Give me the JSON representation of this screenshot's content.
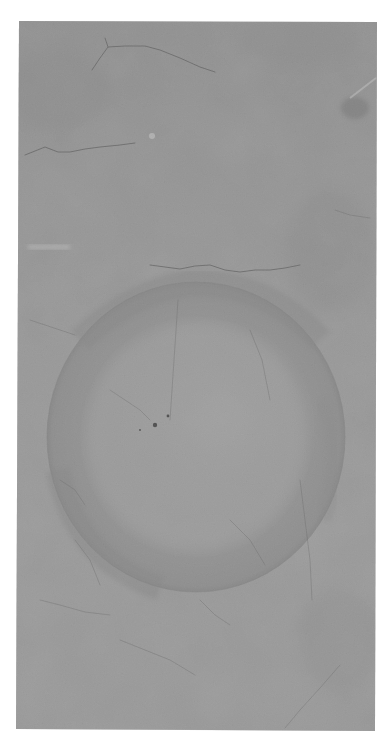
{
  "image": {
    "description": "Photograph of a cracked grey concrete surface with a large circular ring stain",
    "background_color": "#ffffff",
    "photo": {
      "bounds": {
        "x1": 18,
        "y1": 21,
        "x2": 376,
        "y2": 731
      },
      "base_color": "#9a9a9a",
      "light_color": "#ababab",
      "dark_color": "#858585"
    },
    "ring_stain": {
      "cx": 196,
      "cy": 437,
      "rx": 149,
      "ry": 155,
      "ring_color": "#8a8a8a",
      "inner_color": "#a6a6a6",
      "edge_color": "#7e7e7e"
    },
    "specks": [
      {
        "x": 155,
        "y": 425,
        "r": 2.2
      },
      {
        "x": 168,
        "y": 416,
        "r": 1.4
      },
      {
        "x": 140,
        "y": 430,
        "r": 0.9
      }
    ],
    "marks": {
      "light_streak_left": {
        "x": 28,
        "y": 245,
        "w": 42,
        "h": 4
      },
      "light_fleck": {
        "x": 152,
        "y": 136,
        "r": 3
      },
      "dark_smudge_right": {
        "x": 355,
        "y": 108,
        "rx": 14,
        "ry": 11
      }
    },
    "cracks": [
      "M92,70 L100,58 L108,47 L125,46 L145,46 L160,50 L180,58 L200,67 L215,72",
      "M108,47 L105,38",
      "M25,155 L45,147 L58,152 L70,152 L85,149 L100,147 L120,145 L135,143",
      "M150,265 L165,267 L180,269 L195,266 L210,265 L225,270 L240,272 L255,270 L270,270 L285,268 L300,265",
      "M340,665 L320,688 L300,710 L285,728",
      "M30,320 L45,325 L60,330 L75,335",
      "M178,300 L176,330 L174,360 L172,390 L170,420",
      "M110,390 L125,400 L140,410 L150,420",
      "M250,330 L262,360 L270,400",
      "M40,600 L60,605 L85,612 L110,615",
      "M120,640 L145,650 L170,660 L195,675",
      "M300,480 L305,520 L310,560 L312,600",
      "M60,480 L75,490 L85,505",
      "M230,520 L250,540 L265,565",
      "M335,210 L350,215 L370,218",
      "M75,540 L90,560 L100,585",
      "M200,600 L215,615 L230,625"
    ]
  }
}
